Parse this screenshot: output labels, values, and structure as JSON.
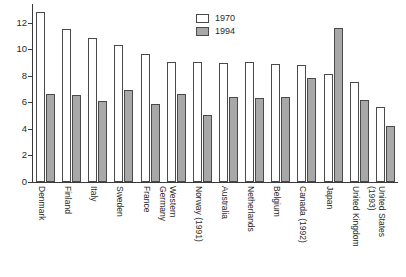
{
  "chart_data": {
    "type": "bar",
    "title": "",
    "subtitle": "",
    "xlabel": "",
    "ylabel": "",
    "ylim": [
      0,
      13.4
    ],
    "yticks": [
      0,
      2,
      4,
      6,
      8,
      10,
      12
    ],
    "ytick_labels": [
      "0",
      "2",
      "4",
      "6",
      "8",
      "10",
      "12"
    ],
    "grid": false,
    "legend_position": "top-center-right",
    "categories": [
      "Denmark",
      "Finland",
      "Italy",
      "Sweden",
      "France",
      "Western Germany",
      "Norway (1991)",
      "Australia",
      "Netherlands",
      "Belgium",
      "Canada (1992)",
      "Japan",
      "United Kingdom",
      "United States (1993)"
    ],
    "category_label_lines": [
      [
        "Denmark"
      ],
      [
        "Finland"
      ],
      [
        "Italy"
      ],
      [
        "Sweden"
      ],
      [
        "France"
      ],
      [
        "Western",
        "Germany"
      ],
      [
        "Norway (1991)"
      ],
      [
        "Australia"
      ],
      [
        "Netherlands"
      ],
      [
        "Belgium"
      ],
      [
        "Canada (1992)"
      ],
      [
        "Japan"
      ],
      [
        "United Kingdom"
      ],
      [
        "United States",
        "(1993)"
      ]
    ],
    "series": [
      {
        "name": "1970",
        "color": "#ffffff",
        "edge_color": "#4a4a4a",
        "values": [
          12.8,
          11.5,
          10.85,
          10.35,
          9.6,
          9.0,
          9.0,
          8.95,
          9.0,
          8.9,
          8.8,
          8.15,
          7.55,
          5.65
        ]
      },
      {
        "name": "1994",
        "color": "#a8a8a8",
        "edge_color": "#4a4a4a",
        "values": [
          6.65,
          6.55,
          6.1,
          6.95,
          5.85,
          6.6,
          5.05,
          6.4,
          6.3,
          6.4,
          7.8,
          11.6,
          6.15,
          4.25
        ]
      }
    ]
  },
  "legend": {
    "items": [
      {
        "label": "1970",
        "swatch": "white-outline-swatch"
      },
      {
        "label": "1994",
        "swatch": "gray-filled-swatch"
      }
    ]
  }
}
